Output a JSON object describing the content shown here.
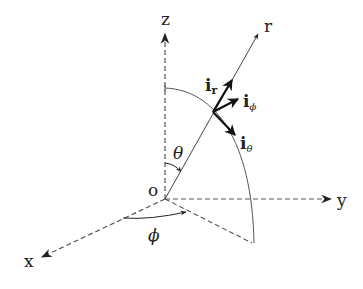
{
  "diagram": {
    "axes": {
      "z": "z",
      "y": "y",
      "x": "x",
      "r": "r",
      "origin": "o"
    },
    "angles": {
      "theta": "θ",
      "phi": "ϕ"
    },
    "unit_vectors": {
      "r": {
        "base": "i",
        "sub": "r"
      },
      "phi": {
        "base": "i",
        "sub": "ϕ"
      },
      "theta": {
        "base": "i",
        "sub": "θ"
      }
    },
    "colors": {
      "line": "#222222",
      "dashed": "#555555",
      "background": "#ffffff"
    }
  }
}
